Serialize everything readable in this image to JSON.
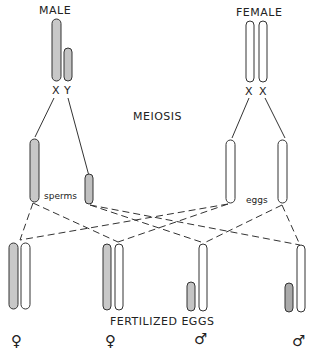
{
  "labels": {
    "male": "MALE",
    "female": "FEMALE",
    "male_x": "X",
    "male_y": "Y",
    "female_x1": "X",
    "female_x2": "X",
    "meiosis": "MEIOSIS",
    "sperms": "sperms",
    "eggs": "eggs",
    "fertilized_eggs": "FERTILIZED EGGS"
  },
  "offspring_symbols": [
    "♀",
    "♀",
    "♂",
    "♂"
  ],
  "colors": {
    "stroke": "#333333",
    "shaded_x": "#c8c8c8",
    "shaded_y": "#b0b0b0",
    "unshaded": "#ffffff"
  }
}
